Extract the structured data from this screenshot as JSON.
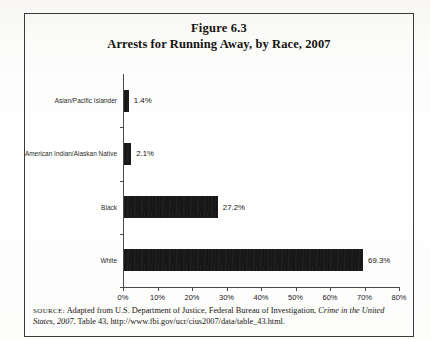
{
  "figure": {
    "title_line_1": "Figure 6.3",
    "title_line_2": "Arrests for Running Away, by Race, 2007"
  },
  "source": {
    "label": "SOURCE:",
    "text_1": " Adapted from U.S. Department of Justice, Federal Bureau of Investigation, ",
    "italic_1": "Crime in the United States, 2007",
    "text_2": ", Table 43, http://www.fbi.gov/ucr/cius2007/data/table_43.html."
  },
  "chart_data": {
    "type": "bar",
    "orientation": "horizontal",
    "title": "Arrests for Running Away, by Race, 2007",
    "categories": [
      "Asian/Pacific Islander",
      "American Indian/Alaskan Native",
      "Black",
      "White"
    ],
    "values": [
      1.4,
      2.1,
      27.2,
      69.3
    ],
    "data_labels": [
      "1.4%",
      "2.1%",
      "27.2%",
      "69.3%"
    ],
    "xlabel": "",
    "ylabel": "",
    "xlim": [
      0,
      80
    ],
    "xticks": [
      0,
      10,
      20,
      30,
      40,
      50,
      60,
      70,
      80
    ],
    "xtick_labels": [
      "0%",
      "10%",
      "20%",
      "30%",
      "40%",
      "50%",
      "60%",
      "70%",
      "80%"
    ],
    "grid": false,
    "legend": false,
    "bar_color": "#141414"
  }
}
